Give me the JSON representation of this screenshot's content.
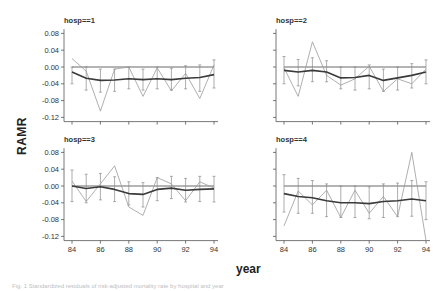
{
  "figure": {
    "ylabel": "RAMR",
    "xlabel": "year",
    "caption": "Fig. 1 Standardized residuals of risk-adjusted mortality rate by hospital and year"
  },
  "chart_data": [
    {
      "type": "line",
      "title": "hosp==1",
      "x": [
        84,
        85,
        86,
        87,
        88,
        89,
        90,
        91,
        92,
        93,
        94
      ],
      "xticks": [
        84,
        86,
        88,
        90,
        92,
        94
      ],
      "yticks": [
        0.08,
        0.04,
        0.0,
        -0.04,
        -0.08,
        -0.12
      ],
      "ylim": [
        -0.13,
        0.09
      ],
      "series": [
        {
          "name": "observed",
          "style": "thin",
          "values": [
            0.02,
            -0.01,
            -0.105,
            -0.005,
            0.0,
            -0.07,
            -0.002,
            -0.057,
            -0.015,
            -0.075,
            0.005
          ]
        },
        {
          "name": "smoothed",
          "style": "thick",
          "values": [
            -0.012,
            -0.027,
            -0.032,
            -0.031,
            -0.028,
            -0.03,
            -0.028,
            -0.03,
            -0.027,
            -0.025,
            -0.018
          ]
        },
        {
          "name": "reference",
          "style": "hline",
          "values": [
            0,
            0,
            0,
            0,
            0,
            0,
            0,
            0,
            0,
            0,
            0
          ]
        }
      ],
      "error_bars": {
        "lower": [
          -0.04,
          -0.055,
          -0.06,
          -0.058,
          -0.052,
          -0.055,
          -0.052,
          -0.055,
          -0.052,
          -0.058,
          -0.05
        ],
        "upper": [
          0.0,
          0.0,
          -0.005,
          -0.005,
          0.0,
          -0.005,
          0.0,
          -0.003,
          0.003,
          0.005,
          0.017
        ]
      }
    },
    {
      "type": "line",
      "title": "hosp==2",
      "x": [
        84,
        85,
        86,
        87,
        88,
        89,
        90,
        91,
        92,
        93,
        94
      ],
      "xticks": [
        84,
        86,
        88,
        90,
        92,
        94
      ],
      "yticks": [
        0.08,
        0.04,
        0.0,
        -0.04,
        -0.08,
        -0.12
      ],
      "ylim": [
        -0.13,
        0.09
      ],
      "series": [
        {
          "name": "observed",
          "style": "thin",
          "values": [
            -0.002,
            -0.07,
            0.06,
            -0.02,
            -0.043,
            -0.028,
            0.002,
            -0.058,
            -0.028,
            -0.04,
            -0.005
          ]
        },
        {
          "name": "smoothed",
          "style": "thick",
          "values": [
            -0.008,
            -0.012,
            -0.008,
            -0.012,
            -0.026,
            -0.025,
            -0.02,
            -0.032,
            -0.026,
            -0.02,
            -0.012
          ]
        },
        {
          "name": "reference",
          "style": "hline",
          "values": [
            0,
            0,
            0,
            0,
            0,
            0,
            0,
            0,
            0,
            0,
            0
          ]
        }
      ],
      "error_bars": {
        "lower": [
          -0.04,
          -0.045,
          -0.035,
          -0.035,
          -0.052,
          -0.055,
          -0.052,
          -0.058,
          -0.055,
          -0.05,
          -0.04
        ],
        "upper": [
          0.025,
          0.018,
          0.022,
          0.015,
          0.0,
          0.0,
          0.005,
          -0.005,
          0.0,
          0.008,
          0.017
        ]
      }
    },
    {
      "type": "line",
      "title": "hosp==3",
      "x": [
        84,
        85,
        86,
        87,
        88,
        89,
        90,
        91,
        92,
        93,
        94
      ],
      "xticks": [
        84,
        86,
        88,
        90,
        92,
        94
      ],
      "yticks": [
        0.08,
        0.04,
        0.0,
        -0.04,
        -0.08,
        -0.12
      ],
      "ylim": [
        -0.13,
        0.09
      ],
      "series": [
        {
          "name": "observed",
          "style": "thin",
          "values": [
            0.012,
            -0.037,
            0.005,
            0.048,
            -0.05,
            -0.07,
            0.02,
            0.005,
            -0.035,
            0.01,
            -0.005
          ]
        },
        {
          "name": "smoothed",
          "style": "thick",
          "values": [
            0.0,
            -0.006,
            -0.002,
            -0.008,
            -0.018,
            -0.02,
            -0.008,
            -0.005,
            -0.01,
            -0.008,
            -0.007
          ]
        },
        {
          "name": "reference",
          "style": "hline",
          "values": [
            0,
            0,
            0,
            0,
            0,
            0,
            0,
            0,
            0,
            0,
            0
          ]
        }
      ],
      "error_bars": {
        "lower": [
          -0.037,
          -0.04,
          -0.033,
          -0.037,
          -0.045,
          -0.05,
          -0.035,
          -0.03,
          -0.038,
          -0.037,
          -0.038
        ],
        "upper": [
          0.038,
          0.028,
          0.03,
          0.022,
          0.01,
          0.008,
          0.02,
          0.023,
          0.018,
          0.023,
          0.023
        ]
      }
    },
    {
      "type": "line",
      "title": "hosp==4",
      "x": [
        84,
        85,
        86,
        87,
        88,
        89,
        90,
        91,
        92,
        93,
        94
      ],
      "xticks": [
        84,
        86,
        88,
        90,
        92,
        94
      ],
      "xticklabels_visible": true,
      "yticks": [
        0.08,
        0.04,
        0.0,
        -0.04,
        -0.08,
        -0.12
      ],
      "ylim": [
        -0.13,
        0.09
      ],
      "series": [
        {
          "name": "observed",
          "style": "thin",
          "values": [
            -0.095,
            -0.012,
            -0.045,
            -0.01,
            -0.075,
            -0.01,
            -0.065,
            -0.025,
            -0.073,
            0.08,
            -0.13
          ]
        },
        {
          "name": "smoothed",
          "style": "thick",
          "values": [
            -0.018,
            -0.025,
            -0.028,
            -0.035,
            -0.04,
            -0.04,
            -0.042,
            -0.037,
            -0.035,
            -0.031,
            -0.035
          ]
        },
        {
          "name": "reference",
          "style": "hline",
          "values": [
            0,
            0,
            0,
            0,
            0,
            0,
            0,
            0,
            0,
            0,
            0
          ]
        }
      ],
      "error_bars": {
        "lower": [
          -0.062,
          -0.065,
          -0.065,
          -0.073,
          -0.075,
          -0.075,
          -0.078,
          -0.075,
          -0.073,
          -0.072,
          -0.08
        ],
        "upper": [
          0.027,
          0.018,
          0.013,
          0.005,
          0.0,
          0.0,
          -0.002,
          0.005,
          0.007,
          0.013,
          0.01
        ]
      }
    }
  ],
  "panels": [
    {
      "title": "hosp==1",
      "ox": 72,
      "oy": 67,
      "show_y_labels": true,
      "show_x_labels": false
    },
    {
      "title": "hosp==2",
      "ox": 284,
      "oy": 67,
      "show_y_labels": false,
      "show_x_labels": false
    },
    {
      "title": "hosp==3",
      "ox": 72,
      "oy": 186,
      "show_y_labels": true,
      "show_x_labels": true
    },
    {
      "title": "hosp==4",
      "ox": 284,
      "oy": 186,
      "show_y_labels": false,
      "show_x_labels": true
    }
  ],
  "colors": {
    "thin": "#9a9a9a",
    "thick": "#3a3a3a",
    "axis": "#555555",
    "errorbar": "#8a8a8a",
    "reference": "#6a6a6a"
  }
}
